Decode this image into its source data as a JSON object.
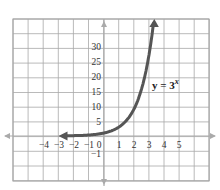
{
  "chart_data": {
    "type": "line",
    "title": "",
    "function": "y = 3^x",
    "annotation": {
      "text_base": "y = 3",
      "text_exp": "x",
      "x": 2.9,
      "y": 20
    },
    "xlabel": "",
    "ylabel": "",
    "x_tick_labels": [
      "−4",
      "−3",
      "−2",
      "−1",
      "0",
      "1",
      "2",
      "3",
      "4",
      "5"
    ],
    "x_ticks": [
      -4,
      -3,
      -2,
      -1,
      0,
      1,
      2,
      3,
      4,
      5
    ],
    "y_tick_labels": [
      "5",
      "10",
      "15",
      "20",
      "25",
      "30"
    ],
    "y_ticks": [
      5,
      10,
      15,
      20,
      25,
      30
    ],
    "y_neg_label": "−1",
    "xlim": [
      -6.1,
      7
    ],
    "ylim": [
      -15,
      38
    ],
    "grid": true,
    "series": [
      {
        "name": "y = 3^x",
        "x": [
          -3,
          -2,
          -1,
          0,
          1,
          2,
          3,
          3.3
        ],
        "y": [
          0.04,
          0.11,
          0.33,
          1,
          3,
          9,
          27,
          37.5
        ]
      }
    ],
    "colors": {
      "curve": "#555555",
      "grid": "#999999",
      "axis": "#aaaaaa"
    }
  }
}
